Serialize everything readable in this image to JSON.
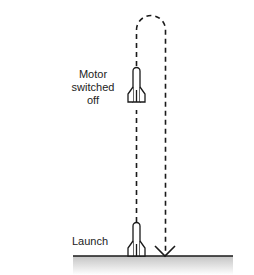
{
  "diagram": {
    "labels": {
      "motor_off": [
        "Motor",
        "switched",
        "off"
      ],
      "launch": "Launch"
    },
    "colors": {
      "line": "#1a1a1a",
      "ground_top": "#c8c8c8",
      "ground_bottom": "#ffffff"
    }
  }
}
